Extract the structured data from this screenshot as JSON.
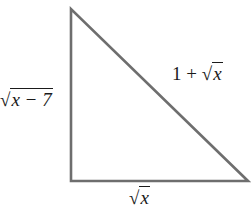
{
  "diagram": {
    "type": "right-triangle",
    "vertices": {
      "top": [
        71,
        9
      ],
      "bottom_left": [
        71,
        181
      ],
      "bottom_right": [
        248,
        181
      ]
    },
    "stroke_color": "#6e6e6e",
    "labels": {
      "left_leg": {
        "prefix": "",
        "radicand": "x − 7",
        "suffix": ""
      },
      "hypotenuse": {
        "prefix": "1 + ",
        "radicand": "x",
        "suffix": ""
      },
      "bottom_leg": {
        "prefix": "",
        "radicand": "x",
        "suffix": ""
      }
    },
    "radical_symbol": "√"
  }
}
